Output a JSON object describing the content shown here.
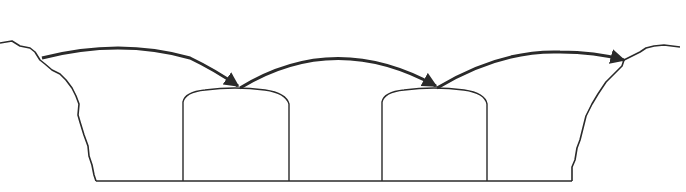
{
  "diagram": {
    "title": "",
    "colors": {
      "background": "#ffffff",
      "stroke": "#2a2a2a",
      "arrow": "#333333"
    },
    "elements": {
      "left_bank": "left-valley-wall",
      "right_bank": "right-valley-wall",
      "ground": "valley-floor",
      "piers": [
        "pier-1",
        "pier-2"
      ],
      "arrows": [
        "arrow-span-1",
        "arrow-span-2",
        "arrow-span-3"
      ]
    }
  }
}
